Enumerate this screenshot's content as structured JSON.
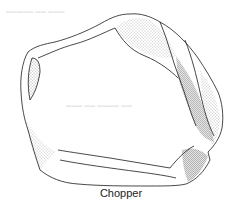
{
  "figure": {
    "caption": "Chopper",
    "ink_color": "#1a1a1a"
  }
}
